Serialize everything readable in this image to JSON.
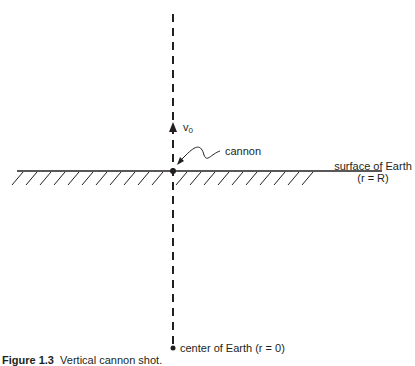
{
  "figure": {
    "caption_number": "Figure 1.3",
    "caption_text": "Vertical cannon shot.",
    "labels": {
      "velocity_symbol": "v",
      "velocity_subscript": "0",
      "cannon": "cannon",
      "surface_line1": "surface of Earth",
      "surface_line2": "(r = R)",
      "center": "center of Earth (r = 0)"
    },
    "colors": {
      "ink": "#231f20",
      "background": "#ffffff"
    }
  }
}
